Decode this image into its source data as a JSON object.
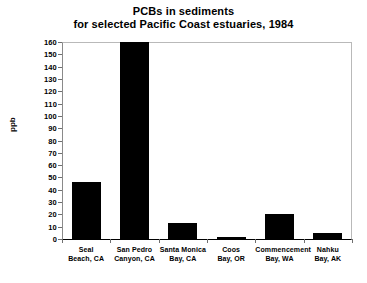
{
  "chart_data": {
    "type": "bar",
    "title": "PCBs in sediments for selected Pacific Coast estuaries, 1984",
    "title_line1": "PCBs in sediments",
    "title_line2": "for selected Pacific Coast estuaries, 1984",
    "xlabel": "",
    "ylabel": "ppb",
    "ylim": [
      0,
      160
    ],
    "ytick_step": 10,
    "yticks": [
      0,
      10,
      20,
      30,
      40,
      50,
      60,
      70,
      80,
      90,
      100,
      110,
      120,
      130,
      140,
      150,
      160
    ],
    "grid": false,
    "legend": false,
    "bar_color": "#000000",
    "background_color": "#ffffff",
    "categories": [
      "Seal Beach, CA",
      "San Pedro Canyon, CA",
      "Santa Monica Bay, CA",
      "Coos Bay, OR",
      "Commencement Bay, WA",
      "Nahku Bay, AK"
    ],
    "category_lines": [
      [
        "Seal",
        "Beach, CA"
      ],
      [
        "San Pedro",
        "Canyon, CA"
      ],
      [
        "Santa Monica",
        "Bay, CA"
      ],
      [
        "Coos",
        "Bay, OR"
      ],
      [
        "Commencement",
        "Bay, WA"
      ],
      [
        "Nahku",
        "Bay, AK"
      ]
    ],
    "values": [
      46,
      160,
      13,
      2,
      20,
      5
    ]
  }
}
